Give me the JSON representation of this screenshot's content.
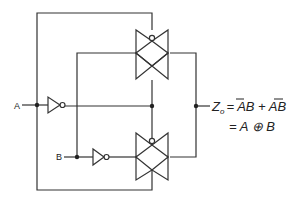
{
  "diagram": {
    "inputs": [
      {
        "label": "A"
      },
      {
        "label": "B"
      }
    ],
    "output": {
      "symbol": "Z",
      "subscript": "o",
      "equation_line1_parts": [
        "= ",
        "A",
        "B + A",
        "B"
      ],
      "equation_line2": "= A ⊕ B"
    },
    "components": [
      {
        "type": "inverter",
        "input": "A"
      },
      {
        "type": "inverter",
        "input": "B"
      },
      {
        "type": "transmission-gate",
        "position": "top"
      },
      {
        "type": "transmission-gate",
        "position": "bottom"
      }
    ],
    "colors": {
      "line": "#333333",
      "background": "#ffffff"
    }
  }
}
